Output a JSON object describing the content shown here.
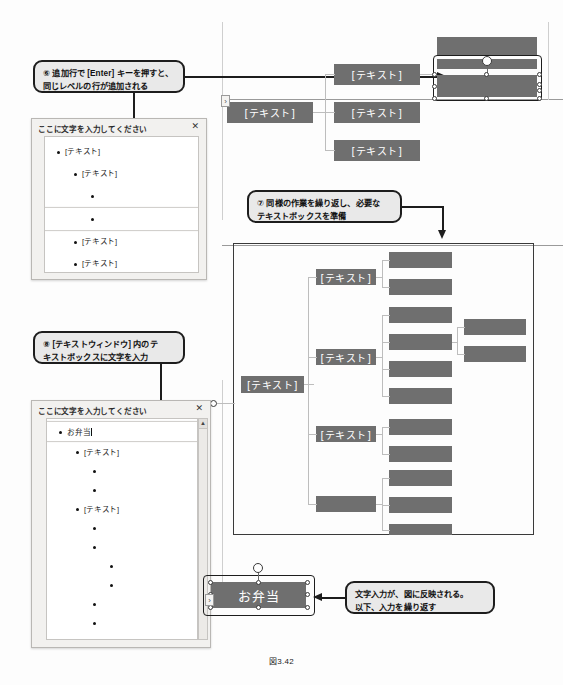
{
  "caption": "図3.42",
  "colors": {
    "shape_fill": "#6f6f6f",
    "callout_fill": "#e9e9e9",
    "callout_border": "#1d1d1d",
    "panel_bg": "#f2f1ef",
    "connector": "#bdbdbd"
  },
  "callouts": [
    {
      "id": "callout-6",
      "lines": [
        "⑥ 追加行で [Enter] キーを押すと、",
        "同じレベルの行が追加される"
      ]
    },
    {
      "id": "callout-7",
      "lines": [
        "⑦ 同様の作業を繰り返し、必要な",
        "テキストボックスを準備"
      ]
    },
    {
      "id": "callout-8",
      "lines": [
        "⑧ [テキストウィンドウ] 内のテ",
        "キストボックスに文字を入力"
      ]
    },
    {
      "id": "callout-9",
      "lines": [
        "文字入力が、図に反映される。",
        "以下、入力を繰り返す"
      ]
    }
  ],
  "text_window_1": {
    "title": "ここに文字を入力してください",
    "close_label": "✕",
    "rows": [
      {
        "indent": 0,
        "label": "[テキスト]",
        "selected": false
      },
      {
        "indent": 1,
        "label": "[テキスト]",
        "selected": false
      },
      {
        "indent": 2,
        "label": "",
        "selected": false
      },
      {
        "indent": 2,
        "label": "",
        "selected": true
      },
      {
        "indent": 1,
        "label": "[テキスト]",
        "selected": false
      },
      {
        "indent": 1,
        "label": "[テキスト]",
        "selected": false
      }
    ]
  },
  "text_window_2": {
    "title": "ここに文字を入力してください",
    "close_label": "✕",
    "scroll_up_label": "▲",
    "rows": [
      {
        "indent": 0,
        "label": "お弁当",
        "selected": true,
        "caret": true
      },
      {
        "indent": 1,
        "label": "[テキスト]",
        "selected": false
      },
      {
        "indent": 2,
        "label": "",
        "selected": false
      },
      {
        "indent": 2,
        "label": "",
        "selected": false
      },
      {
        "indent": 1,
        "label": "[テキスト]",
        "selected": false
      },
      {
        "indent": 2,
        "label": "",
        "selected": false
      },
      {
        "indent": 2,
        "label": "",
        "selected": false
      },
      {
        "indent": 3,
        "label": "",
        "selected": false
      },
      {
        "indent": 3,
        "label": "",
        "selected": false
      },
      {
        "indent": 2,
        "label": "",
        "selected": false
      },
      {
        "indent": 2,
        "label": "",
        "selected": false
      }
    ]
  },
  "top_diagram": {
    "root_label": "[テキスト]",
    "children": [
      {
        "label": "[テキスト]"
      },
      {
        "label": "[テキスト]"
      },
      {
        "label": "[テキスト]"
      }
    ],
    "selected_shape_label": "",
    "chevron_label": "›"
  },
  "main_diagram": {
    "root_label": "[テキスト]",
    "level2": [
      {
        "label": "[テキスト]"
      },
      {
        "label": "[テキスト]"
      },
      {
        "label": "[テキスト]"
      },
      {
        "label": ""
      }
    ],
    "chevron_label": "›"
  },
  "bottom_shape": {
    "label": "お弁当",
    "chevron_label": "›"
  }
}
